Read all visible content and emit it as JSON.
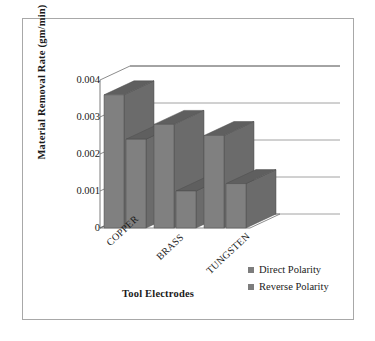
{
  "chart_data": {
    "type": "bar",
    "title": "",
    "subtitle": "",
    "xlabel": "Tool Electrodes",
    "ylabel": "Material Removal Rate  (gm/min)",
    "categories": [
      "COPPER",
      "BRASS",
      "TUNGSTEN"
    ],
    "series": [
      {
        "name": "Direct Polarity",
        "values": [
          0.0036,
          0.0028,
          0.0025
        ]
      },
      {
        "name": "Reverse Polarity",
        "values": [
          0.0024,
          0.001,
          0.0012
        ]
      }
    ],
    "ylim": [
      0,
      0.004
    ],
    "ytick_labels": [
      "0.004",
      "0.003",
      "0.002",
      "0.001",
      "0"
    ],
    "ytick_values": [
      0.004,
      0.003,
      0.002,
      0.001,
      0
    ],
    "grid": true,
    "legend_position": "bottom-right",
    "projection": "3d",
    "colors": {
      "bar_face": "#808080",
      "bar_top": "#5f5f5f",
      "bar_side": "#6b6b6b",
      "legend_swatch": "#7d7d7d",
      "gridline": "#8c8c8c",
      "axis": "#6e6e6e",
      "frame": "#a8a8a8",
      "background": "#ffffff",
      "text": "#1a1a1a"
    }
  },
  "legend": {
    "items": [
      {
        "label": "Direct Polarity"
      },
      {
        "label": "Reverse Polarity"
      }
    ]
  }
}
